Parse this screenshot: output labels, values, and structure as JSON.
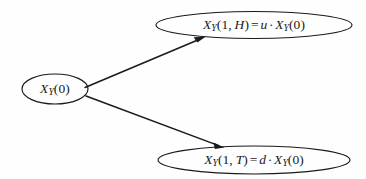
{
  "diagram": {
    "type": "binomial-tree",
    "title": "",
    "background_color": "#fefefe",
    "stroke_color": "#1a1a1a",
    "nodes": {
      "root": {
        "name": "root-node",
        "variable": "X",
        "subscript": "Y",
        "open_paren": "(",
        "time": "0",
        "close_paren": ")",
        "full_text": "X_Y(0)",
        "cx": 55,
        "cy": 89,
        "rx": 33,
        "ry": 15
      },
      "up": {
        "name": "up-node",
        "variable": "X",
        "subscript": "Y",
        "open_paren": "(",
        "time": "1",
        "comma": ",",
        "state": "H",
        "close_paren": ")",
        "equals": "=",
        "factor": "u",
        "cdot": "·",
        "rhs_variable": "X",
        "rhs_subscript": "Y",
        "rhs_time": "0",
        "full_text": "X_Y(1, H) = u · X_Y(0)",
        "cx": 254,
        "cy": 25,
        "rx": 98,
        "ry": 13.5
      },
      "down": {
        "name": "down-node",
        "variable": "X",
        "subscript": "Y",
        "open_paren": "(",
        "time": "1",
        "comma": ",",
        "state": "T",
        "close_paren": ")",
        "equals": "=",
        "factor": "d",
        "cdot": "·",
        "rhs_variable": "X",
        "rhs_subscript": "Y",
        "rhs_time": "0",
        "full_text": "X_Y(1, T) = d · X_Y(0)",
        "cx": 254,
        "cy": 160,
        "rx": 96,
        "ry": 14
      }
    },
    "edges": [
      {
        "name": "edge-root-to-up",
        "from": "root",
        "to": "up",
        "label": "",
        "x1": 85,
        "y1": 87,
        "x2": 200,
        "y2": 38
      },
      {
        "name": "edge-root-to-down",
        "from": "root",
        "to": "down",
        "label": "",
        "x1": 86,
        "y1": 96,
        "x2": 222,
        "y2": 147
      }
    ]
  }
}
